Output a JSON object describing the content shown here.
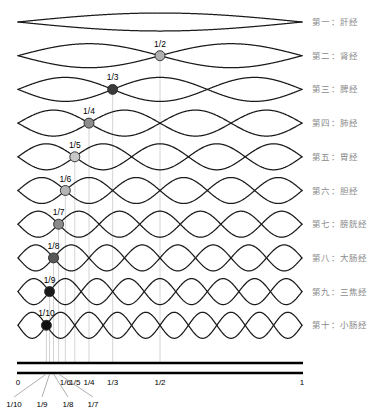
{
  "figure": {
    "type": "standing-wave-diagram",
    "x_axis": {
      "start_value": "0",
      "end_value": "1",
      "start_px": 18,
      "end_px": 302,
      "bar_color": "#000000",
      "ticks": [
        {
          "label": "0",
          "value": 0
        },
        {
          "label": "1/10",
          "value": 0.1
        },
        {
          "label": "1/9",
          "value": 0.1111
        },
        {
          "label": "1/8",
          "value": 0.125
        },
        {
          "label": "1/7",
          "value": 0.1429
        },
        {
          "label": "1/6",
          "value": 0.1667
        },
        {
          "label": "1/5",
          "value": 0.2
        },
        {
          "label": "1/4",
          "value": 0.25
        },
        {
          "label": "1/3",
          "value": 0.3333
        },
        {
          "label": "1/2",
          "value": 0.5
        },
        {
          "label": "1",
          "value": 1
        }
      ],
      "leader_ticks": [
        "1/10",
        "1/9",
        "1/8",
        "1/7"
      ]
    },
    "rows": [
      {
        "index": 1,
        "harmonics": 1,
        "node_label": "",
        "node_value": null,
        "dot_color": null,
        "label": "第一：肝经",
        "amplitude": 9
      },
      {
        "index": 2,
        "harmonics": 2,
        "node_label": "1/2",
        "node_value": 0.5,
        "dot_color": "#b0b0b0",
        "label": "第二：肾经",
        "amplitude": 12
      },
      {
        "index": 3,
        "harmonics": 3,
        "node_label": "1/3",
        "node_value": 0.3333,
        "dot_color": "#3a3a3a",
        "label": "第三：脾经",
        "amplitude": 12
      },
      {
        "index": 4,
        "harmonics": 4,
        "node_label": "1/4",
        "node_value": 0.25,
        "dot_color": "#8c8c8c",
        "label": "第四：肺经",
        "amplitude": 13
      },
      {
        "index": 5,
        "harmonics": 5,
        "node_label": "1/5",
        "node_value": 0.2,
        "dot_color": "#c8c8c8",
        "label": "第五：胃经",
        "amplitude": 13
      },
      {
        "index": 6,
        "harmonics": 6,
        "node_label": "1/6",
        "node_value": 0.1667,
        "dot_color": "#b4b4b4",
        "label": "第六：胆经",
        "amplitude": 13
      },
      {
        "index": 7,
        "harmonics": 7,
        "node_label": "1/7",
        "node_value": 0.1429,
        "dot_color": "#8a8a8a",
        "label": "第七：膀胱经",
        "amplitude": 13
      },
      {
        "index": 8,
        "harmonics": 8,
        "node_label": "1/8",
        "node_value": 0.125,
        "dot_color": "#585858",
        "label": "第八：大肠经",
        "amplitude": 13
      },
      {
        "index": 9,
        "harmonics": 9,
        "node_label": "1/9",
        "node_value": 0.1111,
        "dot_color": "#1a1a1a",
        "label": "第九：三焦经",
        "amplitude": 13
      },
      {
        "index": 10,
        "harmonics": 10,
        "node_label": "1/10",
        "node_value": 0.1,
        "dot_color": "#111111",
        "label": "第十：小肠经",
        "amplitude": 13
      }
    ],
    "colors": {
      "wave_stroke": "#1a1a1a",
      "guide_line": "#c9c9c9",
      "label_text": "#8a8a8a",
      "tick_text": "#000000",
      "fraction_text": "#000000"
    }
  }
}
